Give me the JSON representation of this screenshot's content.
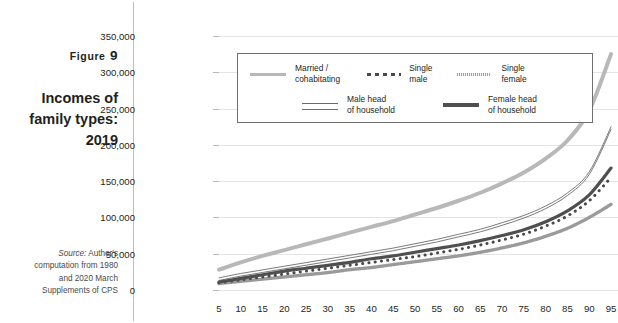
{
  "caption": {
    "figure_word": "Figure",
    "figure_number": "9",
    "title_line1": "Incomes of",
    "title_line2": "family types:",
    "title_line3": "2019",
    "source_label": "Source:",
    "source_line1": " Author's",
    "source_line2": "computation from 1980",
    "source_line3": "and 2020 March",
    "source_line4": "Supplements of CPS"
  },
  "legend": {
    "items": [
      {
        "label_line1": "Married /",
        "label_line2": "cohabitating",
        "style": "solid-thick",
        "color": "#b8b8b8"
      },
      {
        "label_line1": "Single",
        "label_line2": "male",
        "style": "dots",
        "color": "#4a4a4a"
      },
      {
        "label_line1": "Single",
        "label_line2": "female",
        "style": "fine-dash",
        "color": "#9a9a9a"
      },
      {
        "label_line1": "Male head",
        "label_line2": "of household",
        "style": "thin-double",
        "color": "#6b6b6b"
      },
      {
        "label_line1": "Female head",
        "label_line2": "of household",
        "style": "dark-thick",
        "color": "#4f4f4f"
      }
    ]
  },
  "chart_data": {
    "type": "line",
    "title": "Incomes of family types: 2019",
    "xlabel": "",
    "ylabel": "",
    "xlim": [
      0,
      100
    ],
    "ylim": [
      0,
      350000
    ],
    "grid": true,
    "legend_position": "inside-top-center",
    "ytick_labels": [
      "0",
      "50,000",
      "100,000",
      "150,000",
      "200,000",
      "250,000",
      "300,000",
      "350,000"
    ],
    "ytick_values": [
      0,
      50000,
      100000,
      150000,
      200000,
      250000,
      300000,
      350000
    ],
    "categories": [
      5,
      10,
      15,
      20,
      25,
      30,
      35,
      40,
      45,
      50,
      55,
      60,
      65,
      70,
      75,
      80,
      85,
      90,
      95
    ],
    "series": [
      {
        "name": "Married / cohabitating",
        "style": "solid-thick",
        "color": "#b8b8b8",
        "values": [
          28000,
          38000,
          47000,
          55000,
          63000,
          71000,
          79000,
          87000,
          95000,
          104000,
          113000,
          123000,
          134000,
          147000,
          162000,
          181000,
          206000,
          247000,
          325000
        ]
      },
      {
        "name": "Male head of household",
        "style": "thin-double",
        "color": "#6b6b6b",
        "values": [
          14000,
          20000,
          25000,
          30000,
          35000,
          40000,
          45000,
          50000,
          55000,
          61000,
          67000,
          74000,
          81000,
          90000,
          100000,
          113000,
          131000,
          160000,
          222000
        ]
      },
      {
        "name": "Female head of household",
        "style": "dark-thick",
        "color": "#4f4f4f",
        "values": [
          11000,
          16000,
          21000,
          26000,
          30000,
          34000,
          38000,
          43000,
          47000,
          52000,
          57000,
          62000,
          68000,
          75000,
          83000,
          94000,
          109000,
          131000,
          168000
        ]
      },
      {
        "name": "Single male",
        "style": "dots",
        "color": "#4a4a4a",
        "values": [
          10000,
          14000,
          18000,
          22000,
          26000,
          30000,
          34000,
          38000,
          42000,
          46000,
          51000,
          56000,
          62000,
          69000,
          77000,
          88000,
          102000,
          123000,
          155000
        ]
      },
      {
        "name": "Single female",
        "style": "fine-dash",
        "color": "#9a9a9a",
        "values": [
          9000,
          12000,
          15000,
          18000,
          21000,
          24000,
          28000,
          31000,
          35000,
          39000,
          43000,
          47000,
          52000,
          58000,
          65000,
          74000,
          85000,
          100000,
          118000
        ]
      }
    ]
  }
}
